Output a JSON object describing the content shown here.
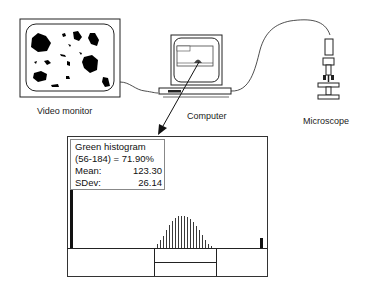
{
  "labels": {
    "video_monitor": "Video monitor",
    "computer": "Computer",
    "microscope": "Microscope"
  },
  "histogram_panel": {
    "title": "Green histogram",
    "range_line": "(56-184) = 71.90%",
    "mean_label": "Mean:",
    "mean_value": "123.30",
    "sdev_label": "SDev:",
    "sdev_value": "26.14"
  },
  "colors": {
    "line": "#111111",
    "blob": "#000000",
    "frame": "#333333"
  }
}
